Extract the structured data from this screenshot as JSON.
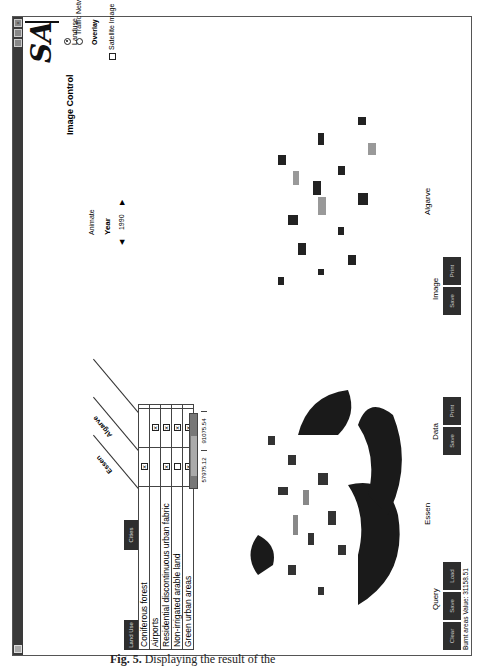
{
  "window": {
    "controls": [
      "close",
      "maximize",
      "minimize"
    ],
    "logo_text": "SA"
  },
  "table_panel": {
    "tabs": [
      {
        "label": "Land Use",
        "active": true
      },
      {
        "label": "Cities",
        "active": false
      }
    ],
    "column_headers": [
      "Essen",
      "Algarve"
    ],
    "rows": [
      {
        "label": "Coniferous forest",
        "essen": true,
        "algarve": false
      },
      {
        "label": "Airports",
        "essen": false,
        "algarve": true
      },
      {
        "label": "Residential discontinuous urban fabric",
        "essen": true,
        "algarve": true
      },
      {
        "label": "Non-irrigated arable land",
        "essen": false,
        "algarve": true
      },
      {
        "label": "Green urban areas",
        "essen": true,
        "algarve": true
      }
    ],
    "totals": [
      "57975.12",
      "91075.54"
    ]
  },
  "maps": [
    {
      "label": "Essen"
    },
    {
      "label": "Algarve"
    }
  ],
  "query_group": {
    "label": "Query",
    "buttons": [
      "Clear",
      "Save",
      "Load"
    ]
  },
  "data_group": {
    "label": "Data",
    "buttons": [
      "Save",
      "Print"
    ]
  },
  "image_group": {
    "label": "Image",
    "buttons": [
      "Save",
      "Print"
    ]
  },
  "status_bar": {
    "text": "Burnt areas Value: 31158.51"
  },
  "image_control": {
    "title": "Image Control",
    "layers": [
      {
        "label": "Landuse",
        "selected": true
      },
      {
        "label": "Traffic Network",
        "selected": false
      }
    ],
    "overlay_title": "Overlay",
    "overlay_options": [
      {
        "label": "Satellite Image",
        "checked": false
      }
    ],
    "animate_label": "Animate",
    "year_title": "Year",
    "year_value": "1990",
    "prev_icon": "◀",
    "next_icon": "▶"
  },
  "caption": {
    "prefix": "Fig. 5.",
    "text": "Displaying the result of the"
  }
}
